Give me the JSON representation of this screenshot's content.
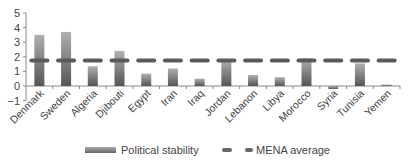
{
  "chart_data": {
    "type": "bar",
    "title": "",
    "xlabel": "",
    "ylabel": "",
    "ylim": [
      -1,
      5
    ],
    "yticks": [
      -1,
      0,
      1,
      2,
      3,
      4,
      5
    ],
    "grid": false,
    "legend_position": "bottom",
    "categories": [
      "Denmark",
      "Sweden",
      "Algeria",
      "Djibouti",
      "Egypt",
      "Iran",
      "Iraq",
      "Jordan",
      "Lebanon",
      "Libya",
      "Morocco",
      "Syria",
      "Tunisia",
      "Yemen"
    ],
    "series": [
      {
        "name": "Political stability",
        "type": "bar",
        "values": [
          3.5,
          3.7,
          1.35,
          2.4,
          0.85,
          1.2,
          0.5,
          1.8,
          0.75,
          0.6,
          1.9,
          -0.2,
          1.55,
          0.1
        ]
      },
      {
        "name": "MENA average",
        "type": "line-dashed",
        "values": [
          1.75,
          1.75,
          1.75,
          1.75,
          1.75,
          1.75,
          1.75,
          1.75,
          1.75,
          1.75,
          1.75,
          1.75,
          1.75,
          1.75
        ]
      }
    ]
  },
  "legend": {
    "bar_label": "Political stability",
    "line_label": "MENA average"
  },
  "colors": {
    "bar_top": "#a8a8a8",
    "bar_bottom": "#555555",
    "dash": "#5a5a5a",
    "axis": "#888888"
  }
}
